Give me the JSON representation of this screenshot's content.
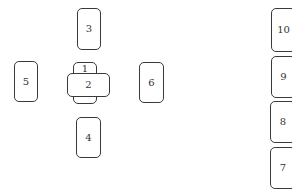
{
  "diagram": {
    "type": "card-spread-layout",
    "cards": [
      {
        "id": "1",
        "label": "1",
        "orientation": "vertical",
        "position": "center"
      },
      {
        "id": "2",
        "label": "2",
        "orientation": "horizontal",
        "position": "center-crossing"
      },
      {
        "id": "3",
        "label": "3",
        "orientation": "vertical",
        "position": "above-center"
      },
      {
        "id": "4",
        "label": "4",
        "orientation": "vertical",
        "position": "below-center"
      },
      {
        "id": "5",
        "label": "5",
        "orientation": "vertical",
        "position": "left-of-center"
      },
      {
        "id": "6",
        "label": "6",
        "orientation": "vertical",
        "position": "right-of-center"
      },
      {
        "id": "7",
        "label": "7",
        "orientation": "vertical",
        "position": "staff-bottom"
      },
      {
        "id": "8",
        "label": "8",
        "orientation": "vertical",
        "position": "staff-lower-middle"
      },
      {
        "id": "9",
        "label": "9",
        "orientation": "vertical",
        "position": "staff-upper-middle"
      },
      {
        "id": "10",
        "label": "10",
        "orientation": "vertical",
        "position": "staff-top"
      }
    ]
  },
  "colors": {
    "background": "#ffffff",
    "card_border": "#3a3a3a",
    "card_text": "#333333"
  }
}
